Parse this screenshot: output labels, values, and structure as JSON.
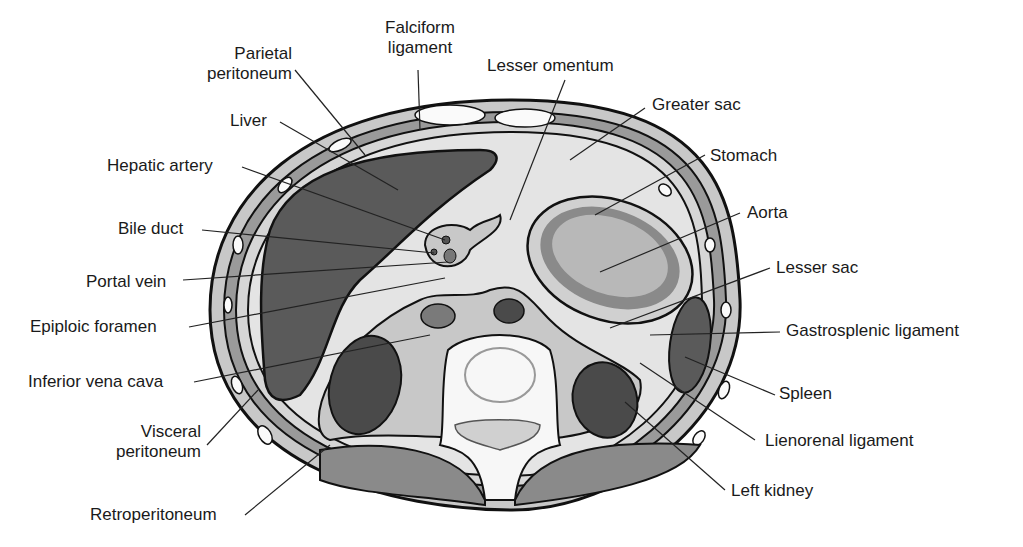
{
  "figure": {
    "colors": {
      "organ_dark": "#5a5a5a",
      "organ_mid": "#8a8a8a",
      "tissue_light": "#c8c8c8",
      "space_pale": "#e4e4e4",
      "bone_white": "#f7f7f7",
      "outline": "#111111"
    }
  },
  "labels": {
    "parietal_peritoneum": [
      "Parietal",
      "peritoneum"
    ],
    "falciform_ligament": [
      "Falciform",
      "ligament"
    ],
    "lesser_omentum": "Lesser omentum",
    "greater_sac": "Greater sac",
    "liver": "Liver",
    "stomach": "Stomach",
    "hepatic_artery": "Hepatic artery",
    "aorta": "Aorta",
    "bile_duct": "Bile duct",
    "lesser_sac": "Lesser sac",
    "portal_vein": "Portal vein",
    "epiploic_foramen": "Epiploic foramen",
    "gastrosplenic_ligament": "Gastrosplenic ligament",
    "inferior_vena_cava": "Inferior vena cava",
    "spleen": "Spleen",
    "visceral_peritoneum": [
      "Visceral",
      "peritoneum"
    ],
    "lienorenal_ligament": "Lienorenal ligament",
    "left_kidney": "Left kidney",
    "retroperitoneum": "Retroperitoneum"
  }
}
